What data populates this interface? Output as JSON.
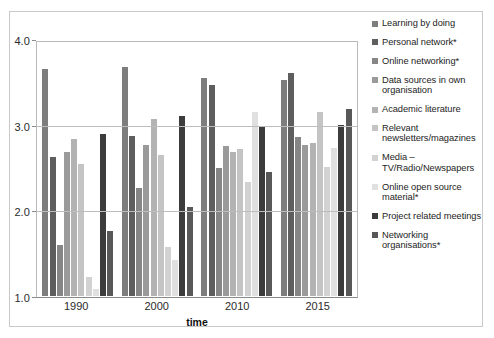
{
  "chart_data": {
    "type": "bar",
    "title": "",
    "xlabel": "time",
    "ylabel": "",
    "categories": [
      "1990",
      "2000",
      "2010",
      "2015"
    ],
    "ylim": [
      1.0,
      4.0
    ],
    "yticks": [
      1.0,
      2.0,
      3.0,
      4.0
    ],
    "ytick_labels": [
      "1.0",
      "2.0",
      "3.0",
      "4.0"
    ],
    "grid": true,
    "legend_position": "right",
    "series": [
      {
        "name": "Learning by doing",
        "color": "#7d7d7d",
        "values": [
          3.67,
          3.69,
          3.57,
          3.54
        ]
      },
      {
        "name": "Personal network*",
        "color": "#5e5e5e",
        "values": [
          2.64,
          2.88,
          3.48,
          3.62
        ]
      },
      {
        "name": "Online networking*",
        "color": "#868686",
        "values": [
          1.6,
          2.27,
          2.51,
          2.87
        ]
      },
      {
        "name": "Data sources in own organisation",
        "color": "#9a9a9a",
        "values": [
          2.7,
          2.78,
          2.76,
          2.78
        ]
      },
      {
        "name": "Academic literature",
        "color": "#b3b3b3",
        "values": [
          2.85,
          3.08,
          2.7,
          2.8
        ]
      },
      {
        "name": "Relevant newsletters/magazines",
        "color": "#c4c4c4",
        "values": [
          2.55,
          2.66,
          2.73,
          3.17
        ]
      },
      {
        "name": "Media – TV/Radio/Newspapers",
        "color": "#d2d2d2",
        "values": [
          1.22,
          1.58,
          2.34,
          2.52
        ]
      },
      {
        "name": "Online open source material*",
        "color": "#e0e0e0",
        "values": [
          1.08,
          1.43,
          3.17,
          2.74
        ]
      },
      {
        "name": "Project related meetings",
        "color": "#3c3c3c",
        "values": [
          2.91,
          3.12,
          2.99,
          3.01
        ]
      },
      {
        "name": "Networking organisations*",
        "color": "#585858",
        "values": [
          1.76,
          2.05,
          2.46,
          3.2
        ]
      }
    ]
  },
  "axes": {
    "y_tick_labels": [
      "4.0",
      "3.0",
      "2.0",
      "1.0"
    ],
    "x_tick_labels": [
      "1990",
      "2000",
      "2010",
      "2015"
    ],
    "x_axis_title": "time"
  },
  "legend": {
    "items": [
      {
        "label": "Learning by doing"
      },
      {
        "label": "Personal network*"
      },
      {
        "label": "Online networking*"
      },
      {
        "label": "Data sources in own organisation"
      },
      {
        "label": "Academic literature"
      },
      {
        "label": "Relevant newsletters/magazines"
      },
      {
        "label": "Media – TV/Radio/Newspapers"
      },
      {
        "label": "Online open source material*"
      },
      {
        "label": "Project related meetings"
      },
      {
        "label": "Networking organisations*"
      }
    ]
  },
  "colors": {
    "background": "#ffffff",
    "frame": "#c9c9c9",
    "gridline": "#bdbdbd",
    "axis": "#8a8a8a",
    "text": "#1a1a1a"
  }
}
